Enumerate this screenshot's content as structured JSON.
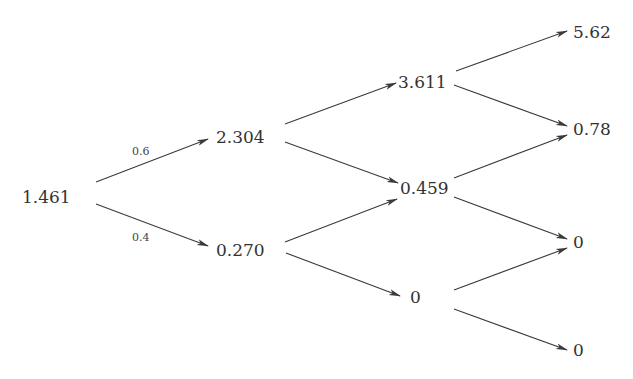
{
  "diagram": {
    "type": "binomial-tree",
    "nodes": {
      "n0": "1.461",
      "n1u": "2.304",
      "n1d": "0.270",
      "n2uu": "3.611",
      "n2ud": "0.459",
      "n2dd": "0",
      "n3uuu": "5.62",
      "n3uud": "0.78",
      "n3udd": "0",
      "n3ddd": "0"
    },
    "edge_labels": {
      "up_prob": "0.6",
      "down_prob": "0.4"
    },
    "colors": {
      "text": "#333333",
      "line": "#3a3a3a",
      "background": "#ffffff"
    }
  }
}
